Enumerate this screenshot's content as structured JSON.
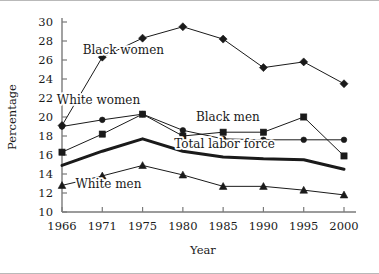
{
  "chart_data": {
    "type": "line",
    "title": "",
    "xlabel": "Year",
    "ylabel": "Percentage",
    "categories": [
      "1966",
      "1971",
      "1975",
      "1980",
      "1985",
      "1990",
      "1995",
      "2000"
    ],
    "x": [
      1966,
      1971,
      1975,
      1980,
      1985,
      1990,
      1995,
      2000
    ],
    "xlim": [
      1966,
      2000
    ],
    "ylim": [
      10,
      30
    ],
    "ytick_labels": [
      "10",
      "12",
      "14",
      "16",
      "18",
      "20",
      "22",
      "24",
      "26",
      "28",
      "30"
    ],
    "ytick_values": [
      10,
      12,
      14,
      16,
      18,
      20,
      22,
      24,
      26,
      28,
      30
    ],
    "ytick_step": 2,
    "grid": false,
    "legend_position": "inline-annotations",
    "series": [
      {
        "name": "Black women",
        "marker": "diamond",
        "label": "Black women",
        "label_x": 1973.4,
        "label_y": 26.6,
        "line_width": 1,
        "values": [
          19.1,
          26.3,
          28.3,
          29.5,
          28.2,
          25.2,
          25.8,
          23.5
        ]
      },
      {
        "name": "White women",
        "marker": "circle",
        "label": "White women",
        "label_x": 1970.4,
        "label_y": 21.4,
        "line_width": 1,
        "values": [
          19.0,
          19.7,
          20.3,
          18.6,
          17.7,
          17.6,
          17.6,
          17.6
        ]
      },
      {
        "name": "Black men",
        "marker": "square",
        "label": "Black men",
        "label_x": 1986.0,
        "label_y": 19.6,
        "line_width": 1,
        "values": [
          16.3,
          18.2,
          20.3,
          18.0,
          18.4,
          18.4,
          20.0,
          15.9
        ]
      },
      {
        "name": "Total labor force",
        "marker": "none",
        "label": "Total labor force",
        "label_x": 1985.6,
        "label_y": 16.7,
        "line_width": 3,
        "values": [
          14.9,
          16.4,
          17.7,
          16.4,
          15.8,
          15.6,
          15.5,
          14.5
        ]
      },
      {
        "name": "White men",
        "marker": "triangle",
        "label": "White men",
        "label_x": 1971.6,
        "label_y": 12.5,
        "line_width": 1,
        "values": [
          12.8,
          13.8,
          14.9,
          13.9,
          12.7,
          12.7,
          12.3,
          11.8
        ]
      }
    ],
    "colors": {
      "line": "#1a1a1a",
      "marker": "#1a1a1a",
      "axis": "#7a7a7a",
      "text": "#1a1a1a",
      "background": "#ffffff"
    }
  }
}
